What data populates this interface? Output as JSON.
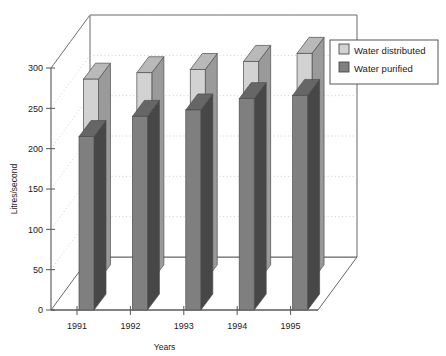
{
  "chart_data": {
    "type": "bar",
    "title": "",
    "subtitle": "",
    "xlabel": "Years",
    "ylabel": "Litres/second",
    "categories": [
      "1991",
      "1992",
      "1993",
      "1994",
      "1995"
    ],
    "series": [
      {
        "name": "Water distributed",
        "values": [
          250,
          258,
          262,
          272,
          282
        ],
        "color": "#d2d2d2"
      },
      {
        "name": "Water purified",
        "values": [
          215,
          240,
          248,
          262,
          266
        ],
        "color": "#7f7f7f"
      }
    ],
    "ylim": [
      0,
      300
    ],
    "yticks": [
      0,
      50,
      100,
      150,
      200,
      250,
      300
    ],
    "ytick_labels": [
      "0",
      "50",
      "100",
      "150",
      "200",
      "250",
      "300"
    ],
    "xtick_labels": [
      "1991",
      "1992",
      "1993",
      "1994",
      "1995"
    ],
    "grid": true,
    "grid_style": "dotted",
    "projection": "3d",
    "legend_position": "right",
    "legend_entries": [
      "Water distributed",
      "Water purified"
    ],
    "background_color": "#ffffff",
    "axis_color": "#555555",
    "grid_color": "#bfbfbf"
  },
  "axes": {
    "y_title": "Litres/second",
    "x_title": "Years"
  },
  "legend": {
    "items": [
      {
        "label": "Water distributed",
        "swatch": "#d2d2d2"
      },
      {
        "label": "Water purified",
        "swatch": "#7f7f7f"
      }
    ]
  }
}
